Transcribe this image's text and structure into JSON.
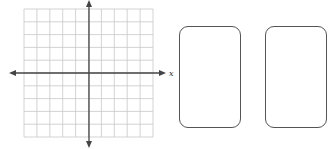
{
  "coordinate_plane": {
    "grid": {
      "columns": 10,
      "rows": 10,
      "left": 24,
      "top": 9,
      "right": 153,
      "bottom": 137
    },
    "x_axis": {
      "label": "x",
      "y": 73,
      "from": 9,
      "to": 166
    },
    "y_axis": {
      "x": 89,
      "from": 0,
      "to": 148
    },
    "grid_color": "#c8c8c8",
    "axis_color": "#444444"
  },
  "cards": [
    {
      "name": "card-1",
      "left": 179,
      "top": 26,
      "width": 62,
      "height": 102
    },
    {
      "name": "card-2",
      "left": 265,
      "top": 26,
      "width": 62,
      "height": 102
    }
  ]
}
